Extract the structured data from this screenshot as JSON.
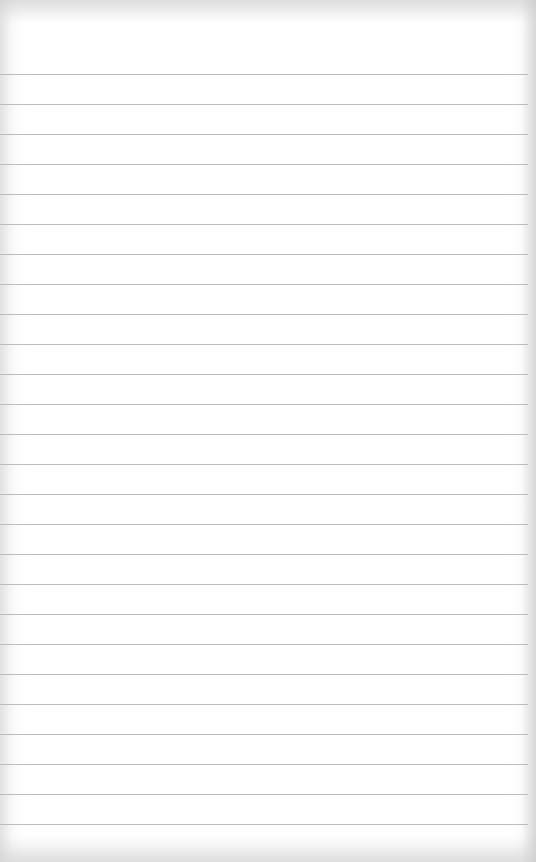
{
  "page": {
    "type": "lined-notepad",
    "paper_color": "#ffffff",
    "rule_color": "#bdbdbd",
    "first_rule_y": 74,
    "rule_spacing": 30,
    "rule_count": 26,
    "text": ""
  }
}
